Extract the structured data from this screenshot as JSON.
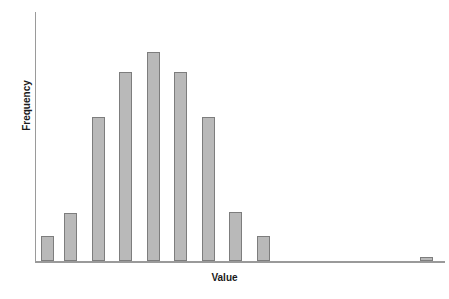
{
  "figure": {
    "width": 449,
    "height": 299,
    "background": "#ffffff"
  },
  "axes": {
    "x_label": "Value",
    "y_label": "Frequency",
    "axis_color": "#9a9a9a",
    "baseline_y_px": 261,
    "y_axis_x_px": 35,
    "y_axis_top_px": 12,
    "x_axis_right_px": 445,
    "ticks_visible": false,
    "tick_labels_visible": false,
    "grid": false
  },
  "style": {
    "bar_fill": "#b9b9b9",
    "bar_edge": "#7d7d7d",
    "label_color": "#1a1a1a"
  },
  "chart_data": {
    "type": "bar",
    "title": "",
    "subtitle": "",
    "xlabel": "Value",
    "ylabel": "Frequency",
    "grid": false,
    "legend": null,
    "xlim": [
      0,
      16
    ],
    "ylim": [
      0,
      230
    ],
    "axis_tick_labels_shown": false,
    "note": "Right-skewed histogram: near-normal main cluster of 9 bins plus one tiny far-right outlier bin separated by a gap of empty bins.",
    "categories": [
      "1",
      "2",
      "3",
      "4",
      "5",
      "6",
      "7",
      "8",
      "9",
      "10",
      "11",
      "12",
      "13",
      "14",
      "15"
    ],
    "values": [
      25,
      48,
      144,
      189,
      209,
      189,
      144,
      49,
      25,
      0,
      0,
      0,
      0,
      0,
      3
    ],
    "bars": [
      {
        "index": 1,
        "x_px": 41,
        "width_px": 13,
        "top_px": 236,
        "height_px": 25,
        "value": 25
      },
      {
        "index": 2,
        "x_px": 64,
        "width_px": 13,
        "top_px": 213,
        "height_px": 48,
        "value": 48
      },
      {
        "index": 3,
        "x_px": 92,
        "width_px": 13,
        "top_px": 117,
        "height_px": 144,
        "value": 144
      },
      {
        "index": 4,
        "x_px": 119,
        "width_px": 13,
        "top_px": 72,
        "height_px": 189,
        "value": 189
      },
      {
        "index": 5,
        "x_px": 147,
        "width_px": 13,
        "top_px": 52,
        "height_px": 209,
        "value": 209
      },
      {
        "index": 6,
        "x_px": 174,
        "width_px": 13,
        "top_px": 72,
        "height_px": 189,
        "value": 189
      },
      {
        "index": 7,
        "x_px": 202,
        "width_px": 13,
        "top_px": 117,
        "height_px": 144,
        "value": 144
      },
      {
        "index": 8,
        "x_px": 229,
        "width_px": 13,
        "top_px": 212,
        "height_px": 49,
        "value": 49
      },
      {
        "index": 9,
        "x_px": 257,
        "width_px": 13,
        "top_px": 236,
        "height_px": 25,
        "value": 25
      },
      {
        "index": 15,
        "x_px": 420,
        "width_px": 13,
        "top_px": 257,
        "height_px": 4,
        "value": 3
      }
    ]
  }
}
